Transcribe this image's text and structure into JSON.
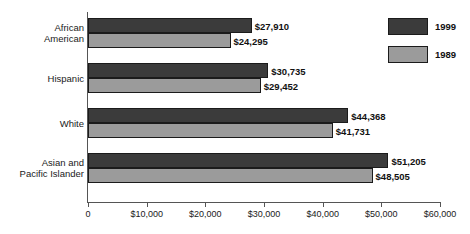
{
  "chart_data": {
    "type": "bar",
    "orientation": "horizontal",
    "title": "",
    "xlabel": "",
    "ylabel": "",
    "categories": [
      "African American",
      "Hispanic",
      "White",
      "Asian and Pacific Islander"
    ],
    "category_lines": [
      [
        "African",
        "American"
      ],
      [
        "Hispanic"
      ],
      [
        "White"
      ],
      [
        "Asian and",
        "Pacific Islander"
      ]
    ],
    "series": [
      {
        "name": "1999",
        "color": "#3b3b3b",
        "values": [
          27910,
          30735,
          44368,
          51205
        ],
        "labels": [
          "$27,910",
          "$30,735",
          "$44,368",
          "$51,205"
        ]
      },
      {
        "name": "1989",
        "color": "#9b9b9b",
        "values": [
          24295,
          29452,
          41731,
          48505
        ],
        "labels": [
          "$24,295",
          "$29,452",
          "$41,731",
          "$48,505"
        ]
      }
    ],
    "xlim": [
      0,
      60000
    ],
    "xticks": [
      0,
      10000,
      20000,
      30000,
      40000,
      50000,
      60000
    ],
    "xticklabels": [
      "0",
      "$10,000",
      "$20,000",
      "$30,000",
      "$40,000",
      "$50,000",
      "$60,000"
    ],
    "grid": false,
    "legend_position": "top-right",
    "legend_entries": [
      {
        "label": "1999",
        "color": "#3b3b3b"
      },
      {
        "label": "1989",
        "color": "#9b9b9b"
      }
    ]
  }
}
